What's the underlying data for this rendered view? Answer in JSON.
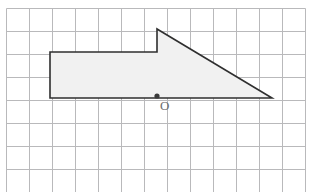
{
  "figure": {
    "type": "geometry-grid-figure",
    "background_color": "#ffffff"
  },
  "grid": {
    "name": "square-grid",
    "origin_x": 6,
    "origin_y": 8,
    "cell_size": 23,
    "columns": 13,
    "rows": 8,
    "line_color": "#b9b9bb",
    "line_width": 1,
    "border_color": "#b9b9bb",
    "width": 299,
    "height": 184
  },
  "shape": {
    "name": "shaded-polygon",
    "fill_color": "#f1f1f1",
    "stroke_color": "#2f2f2f",
    "stroke_width": 1.6,
    "vertices": [
      {
        "label": "A",
        "x": 50,
        "y": 98
      },
      {
        "label": "B",
        "x": 50,
        "y": 52
      },
      {
        "label": "C",
        "x": 157,
        "y": 52
      },
      {
        "label": "D",
        "x": 157,
        "y": 29
      },
      {
        "label": "E",
        "x": 272,
        "y": 98
      }
    ],
    "path": "M 50 98 L 50 52 L 157 52 L 157 29 L 272 98 Z"
  },
  "center_point": {
    "name": "centre-point-O",
    "x": 157,
    "y": 96,
    "radius": 2.6,
    "color": "#3a3a3a",
    "label": "O",
    "label_x": 160,
    "label_y": 99,
    "label_color": "#6e6e6e"
  }
}
